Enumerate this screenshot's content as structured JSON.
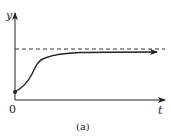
{
  "figure": {
    "caption": "(a)",
    "axes": {
      "x_label": "t",
      "y_label": "y",
      "origin_label": "0"
    },
    "elements": {
      "curve": "logistic-growth curve starting above origin, rising and leveling off",
      "asymptote": "dashed horizontal line (carrying capacity)",
      "start_point": "filled dot on y-axis near origin"
    },
    "colors": {
      "ink": "#222222",
      "background": "#ffffff"
    }
  }
}
